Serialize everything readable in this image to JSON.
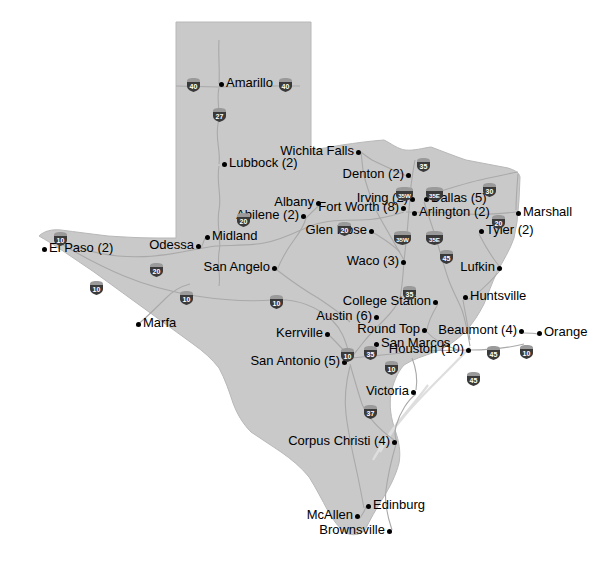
{
  "map": {
    "title": "Texas map with city locations",
    "state": "Texas",
    "fill_color": "#c9c9c9",
    "border_color": "#b4b4b4",
    "road_color": "#a8a8a8",
    "background_color": "#ffffff",
    "label_color": "#000000",
    "dot_color": "#000000"
  },
  "cities": [
    {
      "name": "Amarillo",
      "label": "Amarillo",
      "x": 219,
      "y": 84,
      "side": "r"
    },
    {
      "name": "Wichita Falls",
      "label": "Wichita Falls",
      "x": 361,
      "y": 152,
      "side": "l"
    },
    {
      "name": "Lubbock",
      "label": "Lubbock (2)",
      "x": 222,
      "y": 164,
      "side": "r"
    },
    {
      "name": "Denton",
      "label": "Denton (2)",
      "x": 411,
      "y": 175,
      "side": "l"
    },
    {
      "name": "Dallas",
      "label": "Dallas (5)",
      "x": 424,
      "y": 199,
      "side": "r"
    },
    {
      "name": "Irving",
      "label": "Irving (2)",
      "x": 415,
      "y": 199,
      "side": "l"
    },
    {
      "name": "Arlington",
      "label": "Arlington (2)",
      "x": 412,
      "y": 213,
      "side": "r"
    },
    {
      "name": "Fort Worth",
      "label": "Fort Worth (8)",
      "x": 406,
      "y": 208,
      "side": "l"
    },
    {
      "name": "Albany",
      "label": "Albany",
      "x": 321,
      "y": 203,
      "side": "l"
    },
    {
      "name": "Abilene",
      "label": "Abilene (2)",
      "x": 306,
      "y": 216,
      "side": "l"
    },
    {
      "name": "Marshall",
      "label": "Marshall",
      "x": 516,
      "y": 213,
      "side": "r"
    },
    {
      "name": "Tyler",
      "label": "Tyler (2)",
      "x": 479,
      "y": 231,
      "side": "r"
    },
    {
      "name": "Glen Rose",
      "label": "Glen Rose",
      "x": 374,
      "y": 231,
      "side": "l"
    },
    {
      "name": "Midland",
      "label": "Midland",
      "x": 205,
      "y": 237,
      "side": "r"
    },
    {
      "name": "Odessa",
      "label": "Odessa",
      "x": 201,
      "y": 246,
      "side": "l"
    },
    {
      "name": "El Paso",
      "label": "El Paso (2)",
      "x": 42,
      "y": 249,
      "side": "r"
    },
    {
      "name": "Waco",
      "label": "Waco (3)",
      "x": 406,
      "y": 262,
      "side": "l"
    },
    {
      "name": "San Angelo",
      "label": "San Angelo",
      "x": 277,
      "y": 268,
      "side": "l"
    },
    {
      "name": "Lufkin",
      "label": "Lufkin",
      "x": 502,
      "y": 268,
      "side": "l"
    },
    {
      "name": "Huntsville",
      "label": "Huntsville",
      "x": 463,
      "y": 297,
      "side": "r"
    },
    {
      "name": "College Station",
      "label": "College Station",
      "x": 438,
      "y": 302,
      "side": "l"
    },
    {
      "name": "Austin",
      "label": "Austin (6)",
      "x": 379,
      "y": 317,
      "side": "l"
    },
    {
      "name": "Round Top",
      "label": "Round Top",
      "x": 427,
      "y": 330,
      "side": "l"
    },
    {
      "name": "Beaumont",
      "label": "Beaumont (4)",
      "x": 524,
      "y": 331,
      "side": "l"
    },
    {
      "name": "Orange",
      "label": "Orange",
      "x": 537,
      "y": 333,
      "side": "r"
    },
    {
      "name": "Kerrville",
      "label": "Kerrville",
      "x": 330,
      "y": 334,
      "side": "l"
    },
    {
      "name": "San Marcos",
      "label": "San Marcos",
      "x": 374,
      "y": 344,
      "side": "r"
    },
    {
      "name": "Houston",
      "label": "Houston (10)",
      "x": 471,
      "y": 350,
      "side": "l"
    },
    {
      "name": "Marfa",
      "label": "Marfa",
      "x": 136,
      "y": 324,
      "side": "r"
    },
    {
      "name": "San Antonio",
      "label": "San Antonio (5)",
      "x": 347,
      "y": 362,
      "side": "l"
    },
    {
      "name": "Victoria",
      "label": "Victoria",
      "x": 416,
      "y": 392,
      "side": "l"
    },
    {
      "name": "Corpus Christi",
      "label": "Corpus Christi (4)",
      "x": 397,
      "y": 442,
      "side": "l"
    },
    {
      "name": "Edinburg",
      "label": "Edinburg",
      "x": 366,
      "y": 506,
      "side": "r"
    },
    {
      "name": "McAllen",
      "label": "McAllen",
      "x": 360,
      "y": 516,
      "side": "l"
    },
    {
      "name": "Brownsville",
      "label": "Brownsville",
      "x": 392,
      "y": 531,
      "side": "l"
    }
  ],
  "highway_shields": [
    {
      "number": "40",
      "x": 185,
      "y": 77
    },
    {
      "number": "40",
      "x": 277,
      "y": 77
    },
    {
      "number": "27",
      "x": 211,
      "y": 107
    },
    {
      "number": "35",
      "x": 415,
      "y": 157
    },
    {
      "number": "35W",
      "x": 394,
      "y": 186
    },
    {
      "number": "35E",
      "x": 424,
      "y": 186
    },
    {
      "number": "30",
      "x": 481,
      "y": 182
    },
    {
      "number": "20",
      "x": 490,
      "y": 214
    },
    {
      "number": "20",
      "x": 235,
      "y": 212
    },
    {
      "number": "20",
      "x": 336,
      "y": 221
    },
    {
      "number": "35W",
      "x": 392,
      "y": 230
    },
    {
      "number": "35E",
      "x": 424,
      "y": 230
    },
    {
      "number": "45",
      "x": 438,
      "y": 249
    },
    {
      "number": "10",
      "x": 52,
      "y": 231
    },
    {
      "number": "10",
      "x": 88,
      "y": 280
    },
    {
      "number": "20",
      "x": 148,
      "y": 262
    },
    {
      "number": "10",
      "x": 178,
      "y": 290
    },
    {
      "number": "10",
      "x": 268,
      "y": 294
    },
    {
      "number": "35",
      "x": 401,
      "y": 285
    },
    {
      "number": "10",
      "x": 339,
      "y": 347
    },
    {
      "number": "35",
      "x": 362,
      "y": 345
    },
    {
      "number": "10",
      "x": 383,
      "y": 360
    },
    {
      "number": "45",
      "x": 485,
      "y": 345
    },
    {
      "number": "10",
      "x": 518,
      "y": 344
    },
    {
      "number": "45",
      "x": 465,
      "y": 371
    },
    {
      "number": "37",
      "x": 362,
      "y": 404
    }
  ]
}
